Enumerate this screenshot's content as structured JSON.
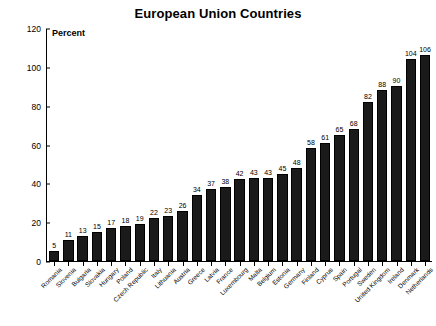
{
  "chart_data": {
    "type": "bar",
    "title": "European Union Countries",
    "xlabel": "",
    "ylabel": "Percent",
    "ylim": [
      0,
      120
    ],
    "yticks": [
      0,
      20,
      40,
      60,
      80,
      100,
      120
    ],
    "grid": false,
    "legend": null,
    "bar_color": "#1a1a1a",
    "categories": [
      "Romania",
      "Slovenia",
      "Bulgaria",
      "Slovakia",
      "Hungary",
      "Poland",
      "Czech Republic",
      "Italy",
      "Lithuania",
      "Austria",
      "Greece",
      "Latvia",
      "France",
      "Luxembourg",
      "Malta",
      "Belgium",
      "Estonia",
      "Germany",
      "Finland",
      "Cyprus",
      "Spain",
      "Portugal",
      "Sweden",
      "United Kingdom",
      "Ireland",
      "Denmark",
      "Netherlands"
    ],
    "values": [
      5,
      11,
      13,
      15,
      17,
      18,
      19,
      22,
      23,
      26,
      34,
      37,
      38,
      42,
      43,
      43,
      45,
      48,
      58,
      61,
      65,
      68,
      82,
      88,
      90,
      104,
      106
    ]
  }
}
